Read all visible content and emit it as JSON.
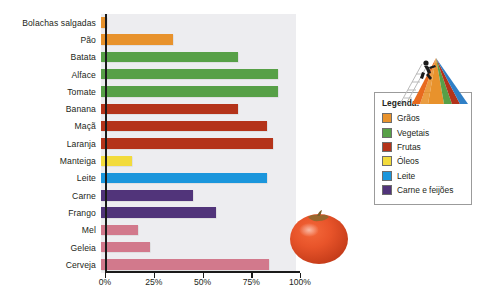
{
  "chart_data": {
    "type": "bar",
    "orientation": "horizontal",
    "title": "",
    "xlabel": "",
    "ylabel": "",
    "xlim": [
      0,
      100
    ],
    "grid": false,
    "categories": [
      "Bolachas salgadas",
      "Pão",
      "Batata",
      "Alface",
      "Tomate",
      "Banana",
      "Maçã",
      "Laranja",
      "Manteiga",
      "Leite",
      "Carne",
      "Frango",
      "Mel",
      "Geleia",
      "Cerveja"
    ],
    "values": [
      3,
      37,
      70,
      91,
      91,
      70,
      85,
      88,
      16,
      85,
      47,
      59,
      19,
      25,
      86
    ],
    "bar_colors": [
      "#E8922C",
      "#E8922C",
      "#57A047",
      "#57A047",
      "#57A047",
      "#B4331A",
      "#B4331A",
      "#B4331A",
      "#F2D githubusercontent",
      "#1B96DC",
      "#51347A",
      "#51347A",
      "#D2798C",
      "#D2798C",
      "#D2798C"
    ],
    "tick_labels": [
      "0%",
      "25%",
      "50%",
      "75%",
      "100%"
    ],
    "tick_values": [
      0,
      25,
      50,
      75,
      100
    ],
    "track_background": "#ededf0"
  },
  "bars": [
    {
      "label": "Bolachas salgadas",
      "value": 3,
      "color": "#E8922C"
    },
    {
      "label": "Pão",
      "value": 37,
      "color": "#E8922C"
    },
    {
      "label": "Batata",
      "value": 70,
      "color": "#57A047"
    },
    {
      "label": "Alface",
      "value": 91,
      "color": "#57A047"
    },
    {
      "label": "Tomate",
      "value": 91,
      "color": "#57A047"
    },
    {
      "label": "Banana",
      "value": 70,
      "color": "#B4331A"
    },
    {
      "label": "Maçã",
      "value": 85,
      "color": "#B4331A"
    },
    {
      "label": "Laranja",
      "value": 88,
      "color": "#B4331A"
    },
    {
      "label": "Manteiga",
      "value": 16,
      "color": "#F2DB3C"
    },
    {
      "label": "Leite",
      "value": 85,
      "color": "#1B96DC"
    },
    {
      "label": "Carne",
      "value": 47,
      "color": "#51347A"
    },
    {
      "label": "Frango",
      "value": 59,
      "color": "#51347A"
    },
    {
      "label": "Mel",
      "value": 19,
      "color": "#D2798C"
    },
    {
      "label": "Geleia",
      "value": 25,
      "color": "#D2798C"
    },
    {
      "label": "Cerveja",
      "value": 86,
      "color": "#D2798C"
    }
  ],
  "axis": {
    "ticks": [
      {
        "label": "0%",
        "value": 0
      },
      {
        "label": "25%",
        "value": 25
      },
      {
        "label": "50%",
        "value": 50
      },
      {
        "label": "75%",
        "value": 75
      },
      {
        "label": "100%",
        "value": 100
      }
    ]
  },
  "legend": {
    "title": "Legenda:",
    "items": [
      {
        "label": "Grãos",
        "color": "#E8922C"
      },
      {
        "label": "Vegetais",
        "color": "#57A047"
      },
      {
        "label": "Frutas",
        "color": "#B4331A"
      },
      {
        "label": "Óleos",
        "color": "#F2DB3C"
      },
      {
        "label": "Leite",
        "color": "#1B96DC"
      },
      {
        "label": "Carne e feijões",
        "color": "#51347A"
      }
    ]
  },
  "graphics": {
    "pyramid_name": "food-pyramid-illustration",
    "pyramid_colors": [
      "#E8922C",
      "#57A047",
      "#B4331A",
      "#F2DB3C",
      "#1B96DC",
      "#51347A"
    ],
    "tomato_name": "tomato-photo"
  }
}
